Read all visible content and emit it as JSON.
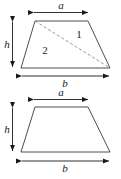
{
  "figure": {
    "stroke_color": "#3a3a3a",
    "dashed_color": "#8a8a8a",
    "arrow_color": "#1a1a1a",
    "background_color": "#ffffff",
    "label_color": "#1a1a1a"
  },
  "upper_figure": {
    "name": "trapezoid-with-diagonal",
    "labels": {
      "top_side": "a",
      "bottom_side": "b",
      "height": "h",
      "region_right": "1",
      "region_left": "2"
    },
    "geometry": {
      "top_left": [
        35,
        21
      ],
      "top_right": [
        88,
        21
      ],
      "bottom_right": [
        110,
        68
      ],
      "bottom_left": [
        21,
        68
      ],
      "diagonal_from": [
        35,
        21
      ],
      "diagonal_to": [
        110,
        68
      ]
    },
    "dimensions": {
      "a_arrow": {
        "x1": 33,
        "x2": 89,
        "y": 12
      },
      "b_arrow": {
        "x1": 21,
        "x2": 110,
        "y": 76
      },
      "h_arrow": {
        "x": 12,
        "y1": 21,
        "y2": 68
      }
    }
  },
  "lower_figure": {
    "name": "plain-trapezoid",
    "labels": {
      "top_side": "a",
      "bottom_side": "b",
      "height": "h"
    },
    "geometry": {
      "top_left": [
        35,
        107
      ],
      "top_right": [
        88,
        107
      ],
      "bottom_right": [
        110,
        152
      ],
      "bottom_left": [
        21,
        152
      ]
    },
    "dimensions": {
      "a_arrow": {
        "x1": 33,
        "x2": 89,
        "y": 99
      },
      "b_arrow": {
        "x1": 21,
        "x2": 110,
        "y": 161
      },
      "h_arrow": {
        "x": 12,
        "y1": 107,
        "y2": 152
      }
    }
  }
}
